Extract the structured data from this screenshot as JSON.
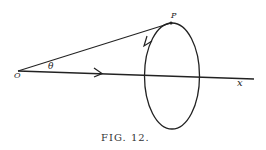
{
  "figure": {
    "caption": "FIG. 12.",
    "labels": {
      "origin": "O",
      "angle": "θ",
      "point": "P",
      "axis": "x"
    },
    "colors": {
      "ink": "#222222",
      "background": "#ffffff"
    }
  }
}
